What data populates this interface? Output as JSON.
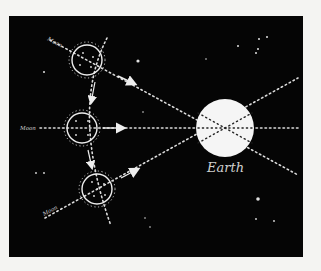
{
  "diagram": {
    "background_color": "#050505",
    "page_color": "#f4f4f2",
    "line_color": "#e8e8e8",
    "earth": {
      "label": "Earth",
      "color": "#f5f5f5"
    },
    "moons": [
      {
        "label": "Moon",
        "position": "top"
      },
      {
        "label": "Moon",
        "position": "middle"
      },
      {
        "label": "Moon",
        "position": "bottom"
      }
    ]
  }
}
